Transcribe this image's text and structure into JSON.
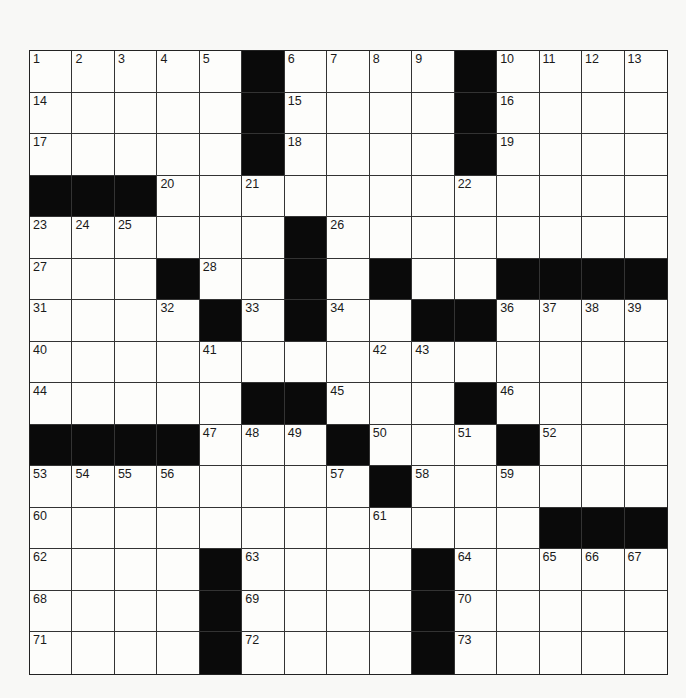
{
  "puzzle": {
    "rows": 15,
    "cols": 15,
    "layout": [
      ".....#....#....",
      ".....#....#....",
      ".....#....#....",
      "###............",
      "......#........",
      "...#..#.#..####",
      "....#.#..##....",
      "...............",
      ".....##...#....",
      "####...#...#...",
      "........#......",
      "............###",
      "....#....#.....",
      "....#....#.....",
      "....#....#....."
    ],
    "numbers": [
      {
        "n": 1,
        "r": 0,
        "c": 0
      },
      {
        "n": 2,
        "r": 0,
        "c": 1
      },
      {
        "n": 3,
        "r": 0,
        "c": 2
      },
      {
        "n": 4,
        "r": 0,
        "c": 3
      },
      {
        "n": 5,
        "r": 0,
        "c": 4
      },
      {
        "n": 6,
        "r": 0,
        "c": 6
      },
      {
        "n": 7,
        "r": 0,
        "c": 7
      },
      {
        "n": 8,
        "r": 0,
        "c": 8
      },
      {
        "n": 9,
        "r": 0,
        "c": 9
      },
      {
        "n": 10,
        "r": 0,
        "c": 11
      },
      {
        "n": 11,
        "r": 0,
        "c": 12
      },
      {
        "n": 12,
        "r": 0,
        "c": 13
      },
      {
        "n": 13,
        "r": 0,
        "c": 14
      },
      {
        "n": 14,
        "r": 1,
        "c": 0
      },
      {
        "n": 15,
        "r": 1,
        "c": 6
      },
      {
        "n": 16,
        "r": 1,
        "c": 11
      },
      {
        "n": 17,
        "r": 2,
        "c": 0
      },
      {
        "n": 18,
        "r": 2,
        "c": 6
      },
      {
        "n": 19,
        "r": 2,
        "c": 11
      },
      {
        "n": 20,
        "r": 3,
        "c": 3
      },
      {
        "n": 21,
        "r": 3,
        "c": 5
      },
      {
        "n": 22,
        "r": 3,
        "c": 10
      },
      {
        "n": 23,
        "r": 4,
        "c": 0
      },
      {
        "n": 24,
        "r": 4,
        "c": 1
      },
      {
        "n": 25,
        "r": 4,
        "c": 2
      },
      {
        "n": 26,
        "r": 4,
        "c": 7
      },
      {
        "n": 27,
        "r": 5,
        "c": 0
      },
      {
        "n": 28,
        "r": 5,
        "c": 4
      },
      {
        "n": 29,
        "r": 5,
        "c": 6
      },
      {
        "n": 30,
        "r": 5,
        "c": 8
      },
      {
        "n": 31,
        "r": 6,
        "c": 0
      },
      {
        "n": 32,
        "r": 6,
        "c": 3
      },
      {
        "n": 33,
        "r": 6,
        "c": 5
      },
      {
        "n": 34,
        "r": 6,
        "c": 7
      },
      {
        "n": 35,
        "r": 6,
        "c": 10
      },
      {
        "n": 36,
        "r": 6,
        "c": 11
      },
      {
        "n": 37,
        "r": 6,
        "c": 12
      },
      {
        "n": 38,
        "r": 6,
        "c": 13
      },
      {
        "n": 39,
        "r": 6,
        "c": 14
      },
      {
        "n": 40,
        "r": 7,
        "c": 0
      },
      {
        "n": 41,
        "r": 7,
        "c": 4
      },
      {
        "n": 42,
        "r": 7,
        "c": 8
      },
      {
        "n": 43,
        "r": 7,
        "c": 9
      },
      {
        "n": 44,
        "r": 8,
        "c": 0
      },
      {
        "n": 45,
        "r": 8,
        "c": 7
      },
      {
        "n": 46,
        "r": 8,
        "c": 11
      },
      {
        "n": 47,
        "r": 9,
        "c": 4
      },
      {
        "n": 48,
        "r": 9,
        "c": 5
      },
      {
        "n": 49,
        "r": 9,
        "c": 6
      },
      {
        "n": 50,
        "r": 9,
        "c": 8
      },
      {
        "n": 51,
        "r": 9,
        "c": 10
      },
      {
        "n": 52,
        "r": 9,
        "c": 12
      },
      {
        "n": 53,
        "r": 10,
        "c": 0
      },
      {
        "n": 54,
        "r": 10,
        "c": 1
      },
      {
        "n": 55,
        "r": 10,
        "c": 2
      },
      {
        "n": 56,
        "r": 10,
        "c": 3
      },
      {
        "n": 57,
        "r": 10,
        "c": 7
      },
      {
        "n": 58,
        "r": 10,
        "c": 9
      },
      {
        "n": 59,
        "r": 10,
        "c": 11
      },
      {
        "n": 60,
        "r": 11,
        "c": 0
      },
      {
        "n": 61,
        "r": 11,
        "c": 8
      },
      {
        "n": 62,
        "r": 12,
        "c": 0
      },
      {
        "n": 63,
        "r": 12,
        "c": 5
      },
      {
        "n": 64,
        "r": 12,
        "c": 10
      },
      {
        "n": 65,
        "r": 12,
        "c": 12
      },
      {
        "n": 66,
        "r": 12,
        "c": 13
      },
      {
        "n": 67,
        "r": 12,
        "c": 14
      },
      {
        "n": 68,
        "r": 13,
        "c": 0
      },
      {
        "n": 69,
        "r": 13,
        "c": 5
      },
      {
        "n": 70,
        "r": 13,
        "c": 10
      },
      {
        "n": 71,
        "r": 14,
        "c": 0
      },
      {
        "n": 72,
        "r": 14,
        "c": 5
      },
      {
        "n": 73,
        "r": 14,
        "c": 10
      }
    ],
    "entries": {}
  },
  "colors": {
    "black_cell": "#0a0a0a",
    "white_cell": "#fdfdfb",
    "grid_line": "#333333",
    "background": "#f8f8f6"
  }
}
